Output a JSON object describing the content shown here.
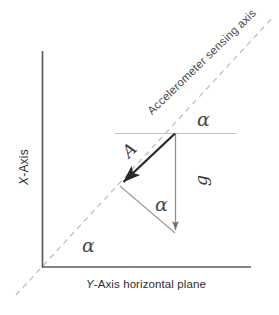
{
  "diagram": {
    "axes": {
      "vertical_label_prefix": "X",
      "vertical_label": "X-Axis",
      "vertical_label_suffix": "-Axis",
      "horizontal_label_prefix": "Y",
      "horizontal_label_suffix": "-Axis  horizontal plane",
      "horizontal_label": "Y-Axis  horizontal plane"
    },
    "sensing_axis": {
      "label": "Accelerometer sensing axis",
      "style": "dashed"
    },
    "vectors": [
      {
        "name": "acceleration-vector",
        "label": "A",
        "description": "thick arrow from apex down-left along sensing axis",
        "from": [
          175,
          133
        ],
        "to": [
          120,
          185
        ]
      },
      {
        "name": "gravity-vector",
        "label": "g",
        "description": "thin vertical arrow from apex straight down",
        "from": [
          175,
          133
        ],
        "to": [
          176,
          235
        ]
      }
    ],
    "angles": [
      {
        "name": "angle-top",
        "label": "α",
        "position": [
          205,
          122
        ]
      },
      {
        "name": "angle-middle",
        "label": "α",
        "position": [
          162,
          207
        ]
      },
      {
        "name": "angle-bottom",
        "label": "α",
        "position": [
          90,
          248
        ]
      }
    ],
    "colors": {
      "axis": "#555555",
      "vector_strong": "#2b2b2b",
      "vector_light": "#8a8a8a",
      "dashed": "#b5b5b5",
      "reference_line": "#bdbdbd",
      "text": "#3a3a3a",
      "background": "#ffffff"
    }
  }
}
